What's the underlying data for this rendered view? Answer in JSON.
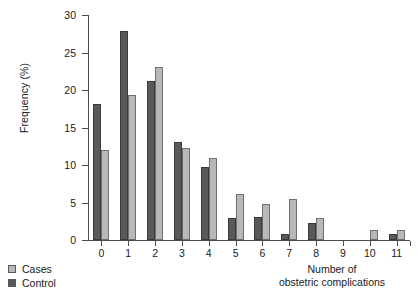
{
  "chart_data": {
    "type": "bar",
    "title": "",
    "subtitle": "",
    "xlabel": "Number of obstetric complications",
    "xlabel_lines": [
      "Number of",
      "obstetric complications"
    ],
    "ylabel": "Frequency (%)",
    "categories": [
      "0",
      "1",
      "2",
      "3",
      "4",
      "5",
      "6",
      "7",
      "8",
      "9",
      "10",
      "11"
    ],
    "xlim": [
      -0.5,
      11.5
    ],
    "ylim": [
      0,
      30
    ],
    "yticks": [
      0,
      5,
      10,
      15,
      20,
      25,
      30
    ],
    "ytick_labels": [
      "0",
      "5",
      "10",
      "15",
      "20",
      "25",
      "30"
    ],
    "grid": false,
    "legend_position": "bottom-left",
    "series": [
      {
        "name": "Cases",
        "color": "#b8b8b8",
        "values": [
          12.0,
          19.3,
          23.1,
          12.3,
          11.0,
          6.2,
          4.8,
          5.5,
          2.9,
          0.0,
          1.3,
          1.3
        ]
      },
      {
        "name": "Control",
        "color": "#595959",
        "values": [
          18.1,
          27.9,
          21.2,
          13.1,
          9.8,
          3.0,
          3.1,
          0.8,
          2.3,
          0.0,
          0.0,
          0.8
        ]
      }
    ],
    "series_draw_order": [
      "Control",
      "Cases"
    ]
  },
  "legend": {
    "items": [
      {
        "label": "Cases",
        "swatch": "cases"
      },
      {
        "label": "Control",
        "swatch": "control"
      }
    ]
  }
}
